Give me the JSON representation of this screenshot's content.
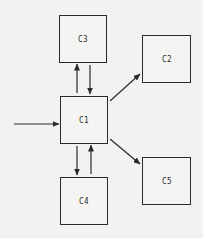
{
  "diagram": {
    "type": "block-diagram",
    "nodes": [
      {
        "id": "C3",
        "label": "C3",
        "x": 59,
        "y": 15,
        "w": 48,
        "h": 48
      },
      {
        "id": "C1",
        "label": "C1",
        "x": 60,
        "y": 96,
        "w": 48,
        "h": 48
      },
      {
        "id": "C4",
        "label": "C4",
        "x": 60,
        "y": 177,
        "w": 48,
        "h": 48
      },
      {
        "id": "C2",
        "label": "C2",
        "x": 142,
        "y": 35,
        "w": 49,
        "h": 48
      },
      {
        "id": "C5",
        "label": "C5",
        "x": 142,
        "y": 157,
        "w": 49,
        "h": 48
      }
    ],
    "edges": [
      {
        "from": "input",
        "to": "C1"
      },
      {
        "from": "C1",
        "to": "C3"
      },
      {
        "from": "C3",
        "to": "C1"
      },
      {
        "from": "C1",
        "to": "C4"
      },
      {
        "from": "C4",
        "to": "C1"
      },
      {
        "from": "C1",
        "to": "C2"
      },
      {
        "from": "C1",
        "to": "C5"
      }
    ],
    "colors": {
      "background": "#f2f2f0",
      "stroke": "#2a2a2a"
    }
  }
}
